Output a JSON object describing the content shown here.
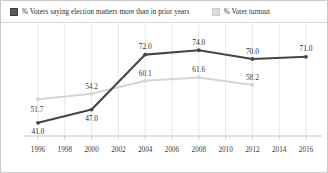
{
  "legend": {
    "position": "top",
    "items": [
      {
        "label": "% Voters saying election matters more than in prior years",
        "color": "#464646",
        "swatch": "dark"
      },
      {
        "label": "% Voter turnout",
        "color": "#d5d5d5",
        "swatch": "light"
      }
    ]
  },
  "axis": {
    "x_ticks": [
      "1996",
      "1998",
      "2000",
      "2002",
      "2004",
      "2006",
      "2008",
      "2010",
      "2012",
      "2014",
      "2016"
    ]
  },
  "chart_data": {
    "type": "line",
    "title": "",
    "xlabel": "",
    "ylabel": "",
    "grid": "vertical",
    "legend_position": "top",
    "x": [
      1996,
      1998,
      2000,
      2002,
      2004,
      2006,
      2008,
      2010,
      2012,
      2014,
      2016
    ],
    "xlim": [
      1996,
      2016
    ],
    "ylim": [
      35,
      80
    ],
    "series": [
      {
        "name": "% Voters saying election matters more than in prior years",
        "color": "#464646",
        "x": [
          1996,
          2000,
          2004,
          2008,
          2012,
          2016
        ],
        "values": [
          41.0,
          47.0,
          72.0,
          74.0,
          70.0,
          71.0
        ],
        "labels": [
          "41.0",
          "47.0",
          "72.0",
          "74.0",
          "70.0",
          "71.0"
        ]
      },
      {
        "name": "% Voter turnout",
        "color": "#d5d5d5",
        "x": [
          1996,
          2000,
          2004,
          2008,
          2012
        ],
        "values": [
          51.7,
          54.2,
          60.1,
          61.6,
          58.2
        ],
        "labels": [
          "51.7",
          "54.2",
          "60.1",
          "61.6",
          "58.2"
        ]
      }
    ]
  }
}
